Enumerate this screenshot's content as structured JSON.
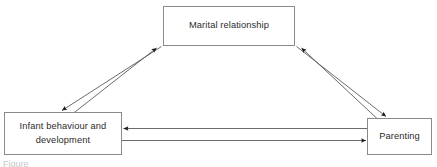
{
  "figure": {
    "type": "diagram",
    "subtype": "triangular-transactional-model",
    "background_color": "#ffffff",
    "border_color": "#8a8a8a",
    "line_color": "#5a5a5a",
    "arrowhead_color": "#1a1a1a",
    "text_color": "#2b2b2b",
    "caption_fragment": "Figure"
  },
  "nodes": [
    {
      "id": "marital",
      "label": "Marital relationship",
      "position": "top-center"
    },
    {
      "id": "infant",
      "label": "Infant behaviour and\ndevelopment",
      "position": "bottom-left"
    },
    {
      "id": "parenting",
      "label": "Parenting",
      "position": "bottom-right"
    }
  ],
  "edges": [
    {
      "id": "marital-to-infant",
      "from": "marital",
      "to": "infant",
      "direction": "down-left",
      "style": "solid-single-arrow"
    },
    {
      "id": "infant-to-marital",
      "from": "infant",
      "to": "marital",
      "direction": "up-right",
      "style": "solid-single-arrow"
    },
    {
      "id": "marital-to-parenting",
      "from": "marital",
      "to": "parenting",
      "direction": "down-right",
      "style": "solid-single-arrow"
    },
    {
      "id": "parenting-to-marital",
      "from": "parenting",
      "to": "marital",
      "direction": "up-left",
      "style": "solid-single-arrow"
    },
    {
      "id": "parenting-to-infant",
      "from": "parenting",
      "to": "infant",
      "direction": "left",
      "style": "solid-single-arrow"
    },
    {
      "id": "infant-to-parenting",
      "from": "infant",
      "to": "parenting",
      "direction": "right",
      "style": "solid-single-arrow"
    }
  ]
}
